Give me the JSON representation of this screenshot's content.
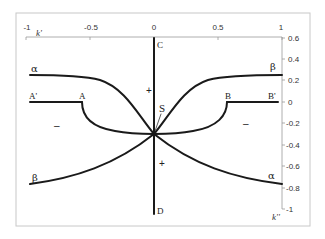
{
  "diagram": {
    "title": "",
    "frame": {
      "color": "#c8c8c8"
    },
    "curve_color": "#1a1a1a",
    "axes": {
      "top": {
        "label": "k'",
        "ticks": [
          {
            "value": -1,
            "label": "-1"
          },
          {
            "value": -0.5,
            "label": "-0.5"
          },
          {
            "value": 0,
            "label": "0"
          },
          {
            "value": 0.5,
            "label": "0.5"
          },
          {
            "value": 1,
            "label": "1"
          }
        ]
      },
      "right": {
        "label": "k''",
        "ticks": [
          {
            "value": 0.6,
            "label": "0.6"
          },
          {
            "value": 0.4,
            "label": "0.4"
          },
          {
            "value": 0.2,
            "label": "0.2"
          },
          {
            "value": 0,
            "label": "0"
          },
          {
            "value": -0.2,
            "label": "-0.2"
          },
          {
            "value": -0.4,
            "label": "-0.4"
          },
          {
            "value": -0.6,
            "label": "-0.6"
          },
          {
            "value": -0.8,
            "label": "-0.8"
          },
          {
            "value": -1,
            "label": "-1"
          }
        ]
      }
    },
    "points": {
      "C": {
        "label": "C",
        "k1": 0,
        "k2": 0.6
      },
      "D": {
        "label": "D",
        "k1": 0,
        "k2": -1.05
      },
      "S": {
        "label": "S",
        "k1": 0,
        "k2": -0.3
      },
      "A": {
        "label": "A",
        "k1": -0.57,
        "k2": 0
      },
      "A_prime": {
        "label": "A'",
        "k1": -0.97,
        "k2": 0
      },
      "B": {
        "label": "B",
        "k1": 0.57,
        "k2": 0
      },
      "B_prime": {
        "label": "B'",
        "k1": 0.97,
        "k2": 0
      }
    },
    "curves": [
      {
        "name": "alpha-upper-left",
        "label": "α",
        "from": [
          -0.97,
          0.26
        ],
        "to": [
          0,
          -0.3
        ]
      },
      {
        "name": "beta-upper-right",
        "label": "β",
        "from": [
          0,
          -0.3
        ],
        "to": [
          0.99,
          0.26
        ]
      },
      {
        "name": "beta-lower-left",
        "label": "β",
        "from": [
          -0.97,
          -0.77
        ],
        "to": [
          0,
          -0.3
        ]
      },
      {
        "name": "alpha-lower-right",
        "label": "α",
        "from": [
          0,
          -0.3
        ],
        "to": [
          0.99,
          -0.77
        ]
      }
    ],
    "signs": {
      "plus_upper": "+",
      "plus_lower": "+",
      "minus_left": "–",
      "minus_right": "–"
    },
    "labels": {
      "alpha_left": "α",
      "beta_right": "β",
      "beta_left": "β",
      "alpha_right": "α"
    }
  }
}
